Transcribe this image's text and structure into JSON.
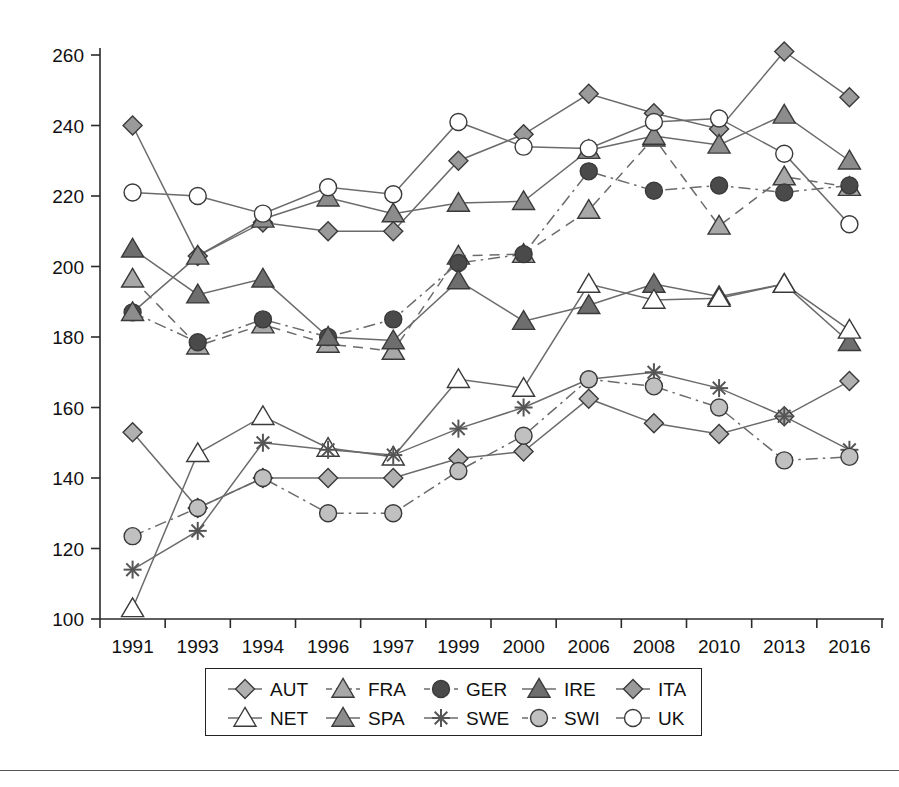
{
  "chart_data": {
    "type": "line",
    "title": "",
    "xlabel": "",
    "ylabel": "",
    "grid": false,
    "legend_position": "bottom",
    "ylim": [
      100,
      260
    ],
    "yticks": [
      100,
      120,
      140,
      160,
      180,
      200,
      220,
      240,
      260
    ],
    "categories": [
      "1991",
      "1993",
      "1994",
      "1996",
      "1997",
      "1999",
      "2000",
      "2006",
      "2008",
      "2010",
      "2013",
      "2016"
    ],
    "series": [
      {
        "name": "AUT",
        "marker": "diamond-filled-light",
        "line": "solid",
        "color": "#b0b0b0",
        "values": [
          153,
          131.5,
          140,
          140,
          140,
          145.5,
          147.5,
          162.5,
          155.5,
          152.5,
          157.5,
          167.5
        ]
      },
      {
        "name": "FRA",
        "marker": "triangle-up-light",
        "line": "dashed",
        "color": "#a8a8a8",
        "values": [
          196.5,
          177.5,
          183.5,
          178,
          176,
          203,
          203.5,
          216,
          236.5,
          211.5,
          225.5,
          222.5
        ]
      },
      {
        "name": "GER",
        "marker": "circle-filled-dark",
        "line": "dash-dot",
        "color": "#4a4a4a",
        "values": [
          187,
          178.5,
          185,
          180,
          185,
          201,
          203.5,
          227,
          221.5,
          223,
          221,
          223
        ]
      },
      {
        "name": "IRE",
        "marker": "triangle-up-dark",
        "line": "solid",
        "color": "#6e6e6e",
        "values": [
          205,
          192,
          196.5,
          180,
          179,
          196,
          184.5,
          189,
          195,
          191.5,
          195,
          178.5
        ]
      },
      {
        "name": "ITA",
        "marker": "diamond-filled-mid",
        "line": "solid",
        "color": "#9a9a9a",
        "values": [
          240,
          203,
          212.5,
          210,
          210,
          230,
          237.5,
          249,
          243.5,
          239,
          261,
          248
        ]
      },
      {
        "name": "NET",
        "marker": "triangle-up-open",
        "line": "solid",
        "color": "#7a7a7a",
        "values": [
          103,
          147,
          157.5,
          148.5,
          146,
          168,
          165.5,
          195,
          190.5,
          191,
          195,
          182
        ]
      },
      {
        "name": "SPA",
        "marker": "triangle-up-mid",
        "line": "solid",
        "color": "#8c8c8c",
        "values": [
          187,
          203,
          213.5,
          219.5,
          215,
          218,
          218.5,
          233,
          237,
          234.5,
          243,
          230
        ]
      },
      {
        "name": "SWE",
        "marker": "asterisk",
        "line": "solid",
        "color": "#5a5a5a",
        "values": [
          114,
          125,
          150,
          148,
          146.5,
          154,
          160,
          168,
          170,
          165.5,
          157.5,
          148
        ]
      },
      {
        "name": "SWI",
        "marker": "circle-filled-light",
        "line": "dash-dot",
        "color": "#c0c0c0",
        "values": [
          123.5,
          131.5,
          140,
          130,
          130,
          142,
          152,
          168,
          166,
          160,
          145,
          146
        ]
      },
      {
        "name": "UK",
        "marker": "circle-open",
        "line": "solid",
        "color": "#8a8a8a",
        "values": [
          221,
          220,
          215,
          222.5,
          220.5,
          241,
          234,
          233.5,
          241,
          242,
          232,
          212
        ]
      }
    ]
  },
  "legend": {
    "row1": [
      "AUT",
      "FRA",
      "GER",
      "IRE",
      "ITA"
    ],
    "row2": [
      "NET",
      "SPA",
      "SWE",
      "SWI",
      "UK"
    ]
  }
}
